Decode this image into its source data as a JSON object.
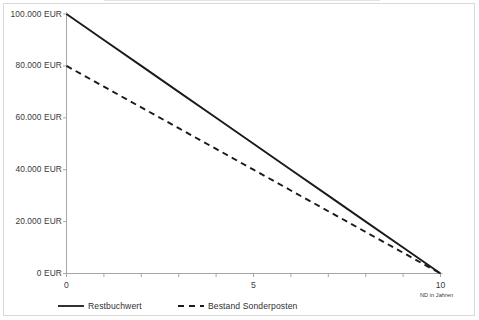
{
  "chart_data": {
    "type": "line",
    "title": "",
    "xlabel": "ND in Jahren",
    "ylabel": "",
    "x": [
      0,
      1,
      2,
      3,
      4,
      5,
      6,
      7,
      8,
      9,
      10
    ],
    "xlim": [
      0,
      10
    ],
    "ylim": [
      0,
      100000
    ],
    "grid": false,
    "legend_position": "bottom",
    "x_ticks": [
      0,
      1,
      2,
      3,
      4,
      5,
      6,
      7,
      8,
      9,
      10
    ],
    "x_tick_labels": [
      "0",
      "",
      "",
      "",
      "",
      "5",
      "",
      "",
      "",
      "",
      "10"
    ],
    "y_ticks": [
      0,
      20000,
      40000,
      60000,
      80000,
      100000
    ],
    "y_tick_labels": [
      "0 EUR",
      "20.000 EUR",
      "40.000 EUR",
      "60.000 EUR",
      "80.000 EUR",
      "100.000 EUR"
    ],
    "series": [
      {
        "name": "Restbuchwert",
        "style": "solid",
        "color": "#1a1a1a",
        "values": [
          100000,
          90000,
          80000,
          70000,
          60000,
          50000,
          40000,
          30000,
          20000,
          10000,
          0
        ]
      },
      {
        "name": "Bestand Sonderposten",
        "style": "dashed",
        "color": "#1a1a1a",
        "values": [
          80000,
          72000,
          64000,
          56000,
          48000,
          40000,
          32000,
          24000,
          16000,
          8000,
          0
        ]
      }
    ]
  },
  "legend": {
    "items": [
      {
        "label": "Restbuchwert"
      },
      {
        "label": "Bestand Sonderposten"
      }
    ]
  },
  "axes": {
    "x_axis_title": "ND in Jahren"
  },
  "colors": {
    "line": "#1a1a1a",
    "axis": "#a6a6a6",
    "border": "#d9d9d9",
    "text": "#3a3a3a"
  }
}
